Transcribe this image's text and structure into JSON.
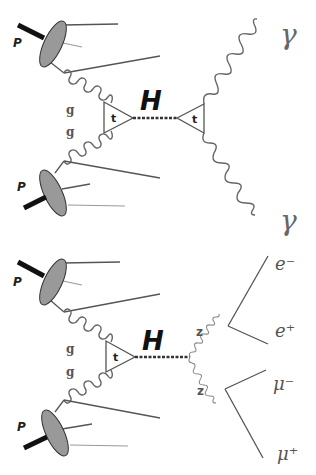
{
  "figure": {
    "diagrams": [
      {
        "id": "h-to-gamma-gamma",
        "process": "gg -> H -> γγ",
        "labels": {
          "proton_top": "P",
          "proton_bottom": "P",
          "gluon_top": "g",
          "gluon_bottom": "g",
          "top_loop_production": "t",
          "higgs": "H",
          "top_loop_decay": "t",
          "photon_top": "γ",
          "photon_bottom": "γ"
        }
      },
      {
        "id": "h-to-zz-to-4l",
        "process": "gg -> H -> ZZ -> e⁻e⁺μ⁻μ⁺",
        "labels": {
          "proton_top": "P",
          "proton_bottom": "P",
          "gluon_top": "g",
          "gluon_bottom": "g",
          "top_loop_production": "t",
          "higgs": "H",
          "z_top": "z",
          "z_bottom": "z",
          "electron": "e⁻",
          "positron": "e⁺",
          "muon_minus": "μ⁻",
          "muon_plus": "μ⁺"
        }
      }
    ],
    "colors": {
      "proton_fill": "#999999",
      "beam": "#111111",
      "lines": "#555555",
      "higgs_line": "#333333"
    }
  }
}
